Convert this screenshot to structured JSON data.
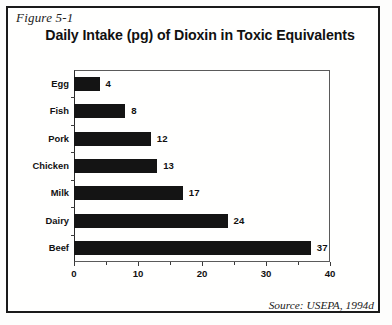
{
  "figure": {
    "caption": "Figure 5-1",
    "title": "Daily Intake (pg) of Dioxin in Toxic Equivalents",
    "source": "Source: USEPA, 1994d"
  },
  "chart_data": {
    "type": "bar",
    "orientation": "horizontal",
    "title": "Daily Intake (pg) of Dioxin in Toxic Equivalents",
    "xlabel": "",
    "ylabel": "",
    "categories": [
      "Egg",
      "Fish",
      "Pork",
      "Chicken",
      "Milk",
      "Dairy",
      "Beef"
    ],
    "values": [
      4,
      8,
      12,
      13,
      17,
      24,
      37
    ],
    "data_labels": [
      "4",
      "8",
      "12",
      "13",
      "17",
      "24",
      "37"
    ],
    "xlim": [
      0,
      40
    ],
    "xticks": [
      0,
      10,
      20,
      30,
      40
    ],
    "xtick_labels": [
      "0",
      "10",
      "20",
      "30",
      "40"
    ],
    "xticks_minor": [
      5,
      15,
      25,
      35
    ],
    "grid": false,
    "legend": false,
    "bar_color": "#141414"
  }
}
